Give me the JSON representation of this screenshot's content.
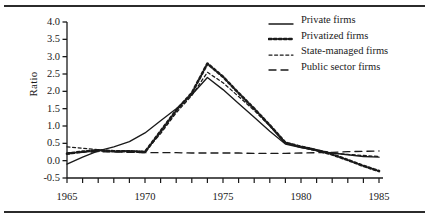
{
  "chart_data": {
    "type": "line",
    "title": "",
    "xlabel": "",
    "ylabel": "Ratio",
    "xlim": [
      1965,
      1985
    ],
    "ylim": [
      -0.5,
      4.0
    ],
    "ytick_values": [
      4.0,
      3.5,
      3.0,
      2.5,
      2.0,
      1.5,
      1.0,
      0.5,
      0.0,
      -0.5
    ],
    "ytick_labels": [
      "4.0",
      "3.5",
      "3.0",
      "2.5",
      "2.0",
      "1.5",
      "1.0",
      "0.5",
      "0.0",
      "-0.5"
    ],
    "xtick_values": [
      1965,
      1970,
      1975,
      1980,
      1985
    ],
    "xtick_labels": [
      "1965",
      "1970",
      "1975",
      "1980",
      "1985"
    ],
    "xtick_minor_step": 1,
    "grid": false,
    "legend_position": "top-right",
    "x": [
      1965,
      1966,
      1967,
      1968,
      1969,
      1970,
      1971,
      1972,
      1973,
      1974,
      1975,
      1976,
      1977,
      1978,
      1979,
      1980,
      1981,
      1982,
      1983,
      1984,
      1985
    ],
    "series": [
      {
        "name": "Private firms",
        "style": "solid",
        "color": "#1a1a1a",
        "values": [
          -0.1,
          0.1,
          0.28,
          0.4,
          0.55,
          0.8,
          1.15,
          1.5,
          1.9,
          2.4,
          2.05,
          1.65,
          1.25,
          0.85,
          0.48,
          0.38,
          0.3,
          0.22,
          0.17,
          0.12,
          0.1
        ]
      },
      {
        "name": "Privatized firms",
        "style": "dotted",
        "color": "#1a1a1a",
        "values": [
          0.2,
          0.26,
          0.3,
          0.27,
          0.27,
          0.25,
          0.85,
          1.45,
          1.95,
          2.8,
          2.42,
          1.95,
          1.5,
          1.02,
          0.52,
          0.4,
          0.3,
          0.18,
          0.02,
          -0.15,
          -0.3
        ]
      },
      {
        "name": "State-managed firms",
        "style": "fine-dashed",
        "color": "#1a1a1a",
        "values": [
          0.4,
          0.36,
          0.32,
          0.28,
          0.28,
          0.27,
          0.78,
          1.38,
          1.88,
          2.55,
          2.25,
          1.85,
          1.45,
          1.0,
          0.5,
          0.42,
          0.32,
          0.22,
          0.18,
          0.15,
          0.12
        ]
      },
      {
        "name": "Public sector firms",
        "style": "long-dashed",
        "color": "#1a1a1a",
        "values": [
          0.22,
          0.24,
          0.26,
          0.25,
          0.24,
          0.23,
          0.23,
          0.23,
          0.22,
          0.22,
          0.22,
          0.22,
          0.21,
          0.21,
          0.21,
          0.22,
          0.23,
          0.24,
          0.26,
          0.27,
          0.28
        ]
      }
    ]
  },
  "axes": {
    "ylabel": "Ratio"
  },
  "legend": {
    "items": [
      {
        "label": "Private firms",
        "style": "solid"
      },
      {
        "label": "Privatized firms",
        "style": "dotted"
      },
      {
        "label": "State-managed firms",
        "style": "fine-dashed"
      },
      {
        "label": "Public sector firms",
        "style": "long-dashed"
      }
    ]
  }
}
